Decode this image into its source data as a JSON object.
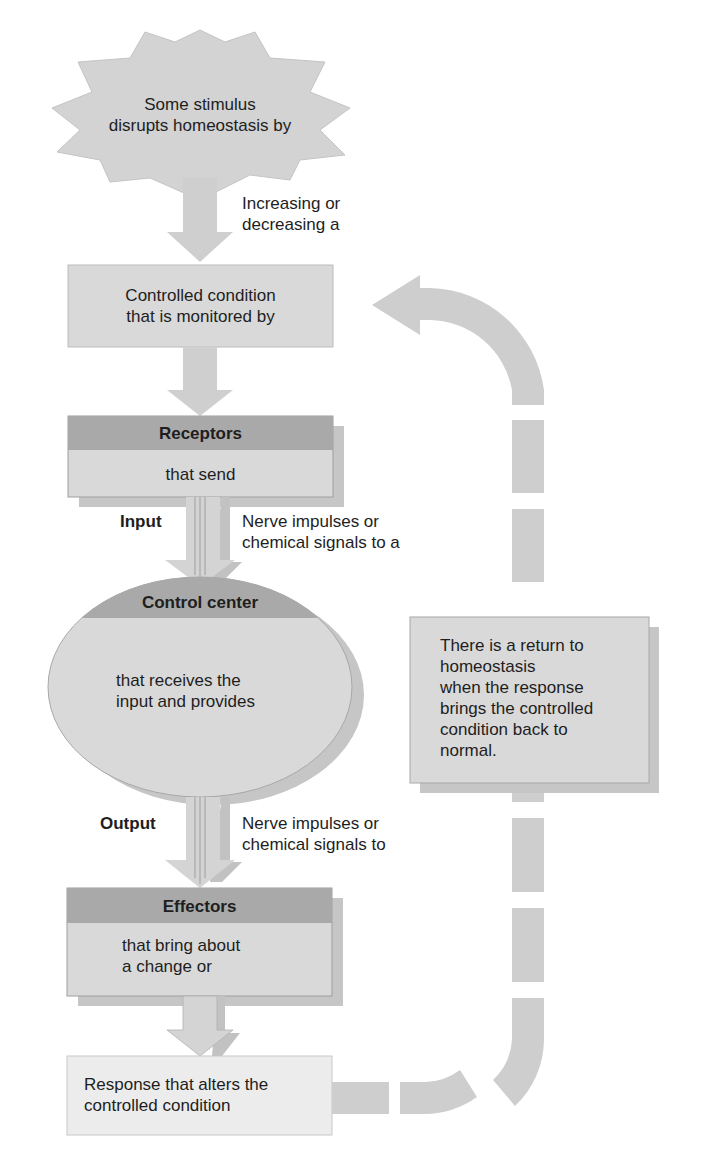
{
  "diagram": {
    "stimulus": {
      "text": "Some stimulus\ndisrupts homeostasis by"
    },
    "stimulus_arrow_label": "Increasing or\ndecreasing a",
    "controlled_condition": {
      "text": "Controlled condition\nthat is monitored by"
    },
    "receptors": {
      "header": "Receptors",
      "body": "that send"
    },
    "input": {
      "label": "Input",
      "description": "Nerve impulses or\nchemical signals to a"
    },
    "control_center": {
      "header": "Control center",
      "body": "that receives the\ninput and provides"
    },
    "output": {
      "label": "Output",
      "description": "Nerve impulses or\nchemical signals to"
    },
    "effectors": {
      "header": "Effectors",
      "body": "that bring about\na change or"
    },
    "response": {
      "text": "Response that alters the\ncontrolled condition"
    },
    "return_note": {
      "text": "There is a return to\nhomeostasis\nwhen the response\nbrings the controlled\ncondition back to\nnormal."
    }
  },
  "colors": {
    "light_fill": "#d9d9d9",
    "header_fill": "#a8a8a8",
    "arrow_fill": "#cfcfcf",
    "response_fill": "#ececec",
    "shadow": "#bdbdbd"
  }
}
